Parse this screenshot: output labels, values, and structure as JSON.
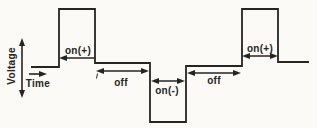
{
  "figure": {
    "colors": {
      "background": "#fbfaf7",
      "ink": "#262522"
    },
    "y_axis": {
      "label": "Voltage"
    },
    "x_axis": {
      "label": "Time"
    },
    "waveform": {
      "type": "square-pulse-train",
      "phases": [
        "on(+)",
        "off",
        "on(-)",
        "off",
        "on(+)"
      ],
      "polarity_sequence": [
        "positive",
        "zero",
        "negative",
        "zero",
        "positive"
      ]
    },
    "labels": {
      "on_positive_1": "on(+)",
      "off_1": "off",
      "on_negative": "on(-)",
      "off_2": "off",
      "on_positive_2": "on(+)"
    }
  }
}
